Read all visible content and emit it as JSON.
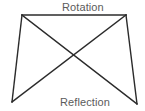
{
  "diagram": {
    "title_top": "Rotation",
    "title_bottom": "Reflection",
    "background_color": "#ffffff",
    "stroke_color": "#2b2b2b",
    "text_color": "#5b5b5b",
    "stroke_width": 1.4,
    "shape_type": "trapezoid-with-diagonals",
    "vertices": {
      "top_left": [
        22,
        15
      ],
      "top_right": [
        126,
        15
      ],
      "bottom_right": [
        137,
        104
      ],
      "bottom_left": [
        12,
        102
      ]
    },
    "edges": [
      {
        "name": "top-edge",
        "from": "top_left",
        "to": "top_right"
      },
      {
        "name": "left-edge",
        "from": "top_left",
        "to": "bottom_left"
      },
      {
        "name": "right-edge",
        "from": "top_right",
        "to": "bottom_right"
      }
    ],
    "diagonals": [
      {
        "name": "diagonal-tl-br",
        "from": "top_left",
        "to": "bottom_right"
      },
      {
        "name": "diagonal-tr-bl",
        "from": "top_right",
        "to": "bottom_left"
      }
    ],
    "intersection_point": [
      74,
      60
    ]
  }
}
